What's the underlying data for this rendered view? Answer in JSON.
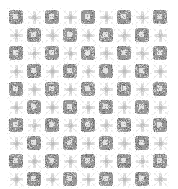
{
  "image": {
    "title": "Grayscale fractal tiling pattern",
    "width": 178,
    "height": 189,
    "background_color": "#ffffff",
    "kind": "generative-pattern"
  },
  "pattern": {
    "name": "checkerboard-fractal-tiling",
    "description": "Checkerboard arrangement of gray filled square motifs alternating with sparse light star/cross motifs, rendered with pixel noise.",
    "margins": {
      "left": 7,
      "top": 8,
      "right": 7,
      "bottom": 9
    },
    "grid": {
      "columns": 9,
      "rows": 10,
      "cell_size": 18,
      "origin_x": 7,
      "origin_y": 8,
      "parity": "dark-when-even-sum"
    },
    "colors": {
      "background": "#ffffff",
      "motif_dark": "#8f8f8f",
      "motif_dark_mid": "#a8a8a8",
      "motif_dark_center": "#c9c9c9",
      "motif_light": "#b8b8b8",
      "motif_light_faint": "#d8d8d8",
      "noise_dark": "#6e6e6e",
      "noise_light": "#e6e6e6"
    },
    "motifs": {
      "dark_cell": {
        "name": "filled-square-motif",
        "shape": "square",
        "inset": 2,
        "has_light_center": true,
        "center_size": 5,
        "corner_nibs": true
      },
      "light_cell": {
        "name": "star-cross-motif",
        "shape": "plus-star",
        "arm_length": 6,
        "arm_thickness": 2,
        "has_diagonal_specks": true
      }
    },
    "noise": {
      "enabled": true,
      "amount": 0.42,
      "seed": 20250114
    }
  }
}
